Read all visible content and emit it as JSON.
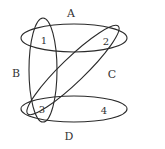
{
  "diagram": {
    "type": "hypergraph",
    "colors": {
      "stroke": "#2a2a2a",
      "text": "#333333",
      "background": "#ffffff"
    },
    "edges": [
      {
        "id": "A",
        "label": "A",
        "members": [
          "1",
          "2"
        ]
      },
      {
        "id": "B",
        "label": "B",
        "members": [
          "1",
          "3"
        ]
      },
      {
        "id": "C",
        "label": "C",
        "members": [
          "2",
          "3"
        ]
      },
      {
        "id": "D",
        "label": "D",
        "members": [
          "3",
          "4"
        ]
      }
    ],
    "vertices": [
      {
        "id": "1",
        "label": "1"
      },
      {
        "id": "2",
        "label": "2"
      },
      {
        "id": "3",
        "label": "3"
      },
      {
        "id": "4",
        "label": "4"
      }
    ]
  }
}
